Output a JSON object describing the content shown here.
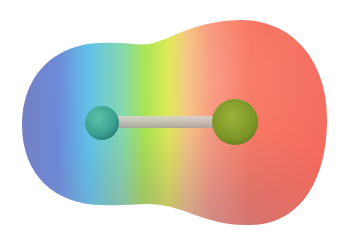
{
  "figure": {
    "subject": "Electrostatic potential map of a diatomic molecule",
    "colors": {
      "background": "#ffffff",
      "blue": "#6f7fcb",
      "cyan": "#5fc3e6",
      "green": "#9be048",
      "yellow": "#e8e84a",
      "orange": "#f7a070",
      "red": "#f76a55",
      "mauve_shadow": "#b88a9a",
      "small_atom": "#3fae9a",
      "large_atom": "#7e9a2a",
      "bond": "#c9c4bf"
    },
    "atoms": [
      {
        "name": "small-atom",
        "cx": 102,
        "cy": 123,
        "r": 17
      },
      {
        "name": "large-atom",
        "cx": 235,
        "cy": 122,
        "r": 23
      }
    ]
  }
}
